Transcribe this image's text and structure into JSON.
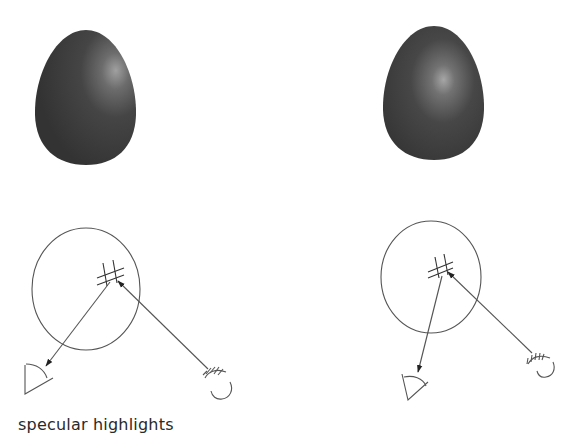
{
  "figure": {
    "caption": "specular highlights",
    "colors": {
      "egg_dark": "#353535",
      "egg_mid": "#474747",
      "egg_highlight": "#9a9a9a",
      "line": "#555555",
      "background": "#ffffff"
    },
    "panels": [
      {
        "name": "left",
        "egg": {
          "label": "egg with highlight at upper right",
          "highlight_position": "upper-right"
        },
        "diagram": {
          "object": "sphere",
          "viewer": "eye",
          "source": "light",
          "highlight_marker": "cross-hatch"
        }
      },
      {
        "name": "right",
        "egg": {
          "label": "egg with highlight near center",
          "highlight_position": "center"
        },
        "diagram": {
          "object": "sphere",
          "viewer": "eye",
          "source": "light",
          "highlight_marker": "cross-hatch"
        }
      }
    ]
  }
}
